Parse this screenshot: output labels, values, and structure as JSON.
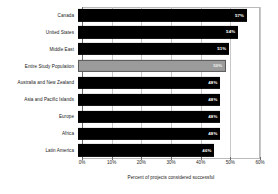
{
  "chart_data": {
    "type": "bar",
    "orientation": "horizontal",
    "title": "",
    "xlabel": "Percent of projects considered successful",
    "ylabel": "",
    "xlim": [
      0,
      60
    ],
    "grid": true,
    "legend": null,
    "xtick_labels": [
      "0%",
      "10%",
      "20%",
      "30%",
      "40%",
      "50%",
      "60%"
    ],
    "xtick_values": [
      0,
      10,
      20,
      30,
      40,
      50,
      60
    ],
    "categories": [
      "Canada",
      "United States",
      "Middle East",
      "Entire Study Population",
      "Australia and New Zealand",
      "Asia and Pacific Islands",
      "Europe",
      "Africa",
      "Latin America"
    ],
    "values": [
      57,
      54,
      51,
      50,
      48,
      48,
      48,
      48,
      46
    ],
    "data_labels": [
      "57%",
      "54%",
      "51%",
      "50%",
      "48%",
      "48%",
      "48%",
      "48%",
      "46%"
    ],
    "highlight_index": 3,
    "colors": {
      "bar": "#000000",
      "highlight_bar": "#9b9b9b",
      "highlight_border": "#5a5a5a",
      "grid": "#c8c8c8",
      "axis": "#6e6e6e",
      "background": "#ffffff",
      "text": "#1a1a1a",
      "data_label_text": "#ffffff"
    }
  }
}
